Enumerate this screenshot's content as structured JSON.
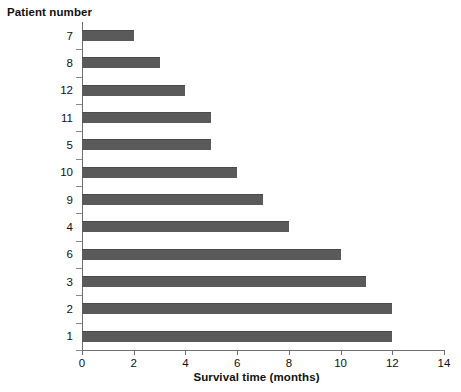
{
  "chart_data": {
    "type": "bar",
    "orientation": "horizontal",
    "title": "",
    "ylabel": "Patient number",
    "xlabel": "Survival time (months)",
    "categories": [
      "7",
      "8",
      "12",
      "11",
      "5",
      "10",
      "9",
      "4",
      "6",
      "3",
      "2",
      "1"
    ],
    "values": [
      2,
      3,
      4,
      5,
      5,
      6,
      7,
      8,
      10,
      11,
      12,
      12
    ],
    "xlim": [
      0,
      14
    ],
    "xticks": [
      0,
      2,
      4,
      6,
      8,
      10,
      12,
      14
    ],
    "xtick_labels": [
      "0",
      "2",
      "4",
      "6",
      "8",
      "10",
      "12",
      "14"
    ],
    "grid": false,
    "legend": false,
    "bar_color": "#5a5a5a",
    "axis_color": "#6f6f6f",
    "background_color": "#ffffff"
  }
}
